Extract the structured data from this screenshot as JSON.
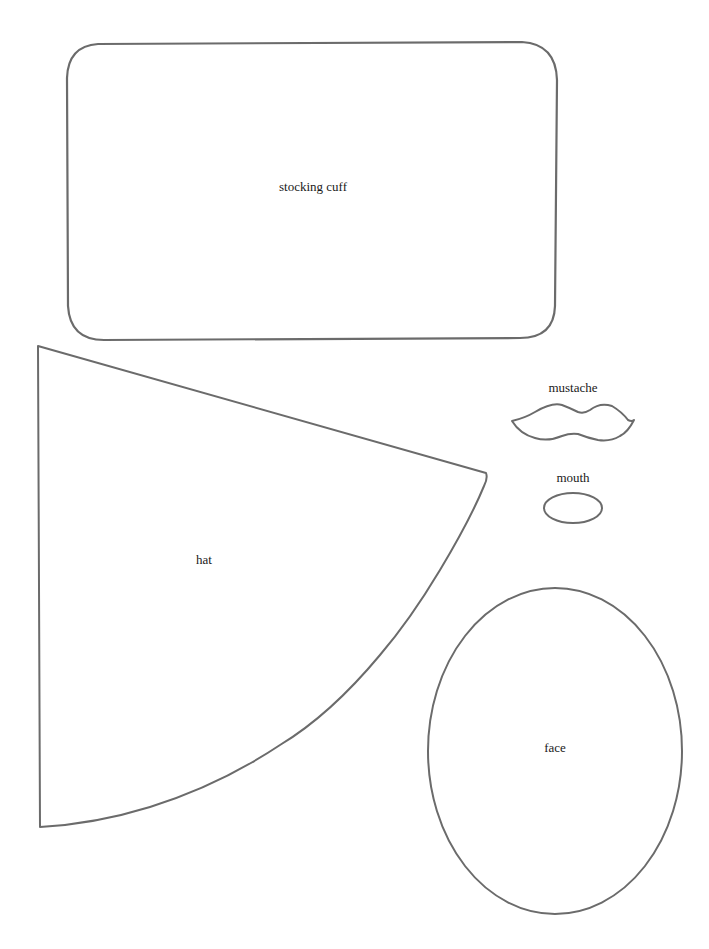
{
  "document": {
    "type": "sewing pattern template sheet",
    "stroke_color": "#6b6b6b",
    "background": "#ffffff"
  },
  "pieces": [
    {
      "id": "stocking-cuff",
      "label": "stocking cuff",
      "shape": "rounded rectangle"
    },
    {
      "id": "hat",
      "label": "hat",
      "shape": "circular sector"
    },
    {
      "id": "mustache",
      "label": "mustache",
      "shape": "mustache"
    },
    {
      "id": "mouth",
      "label": "mouth",
      "shape": "small oval"
    },
    {
      "id": "face",
      "label": "face",
      "shape": "large oval"
    }
  ],
  "labels": {
    "cuff": "stocking cuff",
    "hat": "hat",
    "mustache": "mustache",
    "mouth": "mouth",
    "face": "face"
  }
}
